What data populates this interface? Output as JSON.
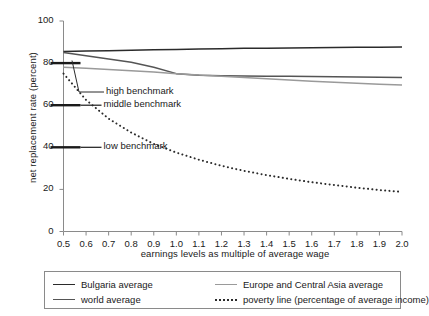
{
  "chart_data": {
    "type": "line",
    "title": "",
    "xlabel": "earnings levels as multiple of average wage",
    "ylabel": "net replacement rate (percent)",
    "xlim": [
      0.5,
      2.0
    ],
    "ylim": [
      0,
      100
    ],
    "grid": false,
    "legend_position": "bottom",
    "x_ticks": [
      "0.5",
      "0.6",
      "0.7",
      "0.8",
      "0.9",
      "1.0",
      "1.1",
      "1.2",
      "1.3",
      "1.4",
      "1.5",
      "1.6",
      "1.7",
      "1.8",
      "1.9",
      "2.0"
    ],
    "y_ticks": [
      "0",
      "20",
      "40",
      "60",
      "80",
      "100"
    ],
    "x": [
      0.5,
      0.6,
      0.7,
      0.8,
      0.9,
      1.0,
      1.1,
      1.2,
      1.3,
      1.4,
      1.5,
      1.6,
      1.7,
      1.8,
      1.9,
      2.0
    ],
    "series": [
      {
        "name": "Bulgaria average",
        "style": "solid",
        "color": "#2b2b2b",
        "values": [
          85.5,
          85.7,
          85.9,
          86.1,
          86.3,
          86.5,
          86.7,
          86.8,
          87.0,
          87.1,
          87.2,
          87.3,
          87.4,
          87.5,
          87.5,
          87.6
        ]
      },
      {
        "name": "world average",
        "style": "solid",
        "color": "#555555",
        "values": [
          85.0,
          83.5,
          82.0,
          80.4,
          78.0,
          75.0,
          74.2,
          74.0,
          73.9,
          73.8,
          73.7,
          73.6,
          73.5,
          73.4,
          73.3,
          73.2
        ]
      },
      {
        "name": "Europe and Central Asia average",
        "style": "solid",
        "color": "#9a9a9a",
        "values": [
          78.0,
          77.5,
          77.0,
          76.4,
          75.8,
          75.0,
          74.4,
          73.8,
          73.2,
          72.6,
          72.0,
          71.4,
          70.9,
          70.4,
          70.0,
          69.6
        ]
      },
      {
        "name": "poverty line (percentage of average income)",
        "style": "dotted",
        "color": "#2b2b2b",
        "values": [
          75.0,
          62.5,
          53.6,
          47.0,
          41.6,
          37.5,
          34.1,
          31.2,
          28.8,
          26.8,
          25.0,
          23.4,
          22.1,
          20.8,
          19.7,
          18.8
        ]
      }
    ],
    "annotations": [
      {
        "label": "high benchmark",
        "level": 80
      },
      {
        "label": "middle benchmark",
        "level": 60
      },
      {
        "label": "low benchmark",
        "level": 40
      }
    ]
  },
  "legend": {
    "items": [
      {
        "label": "Bulgaria average",
        "swatch": "solid-dark"
      },
      {
        "label": "world average",
        "swatch": "solid-mid"
      },
      {
        "label": "Europe and Central Asia average",
        "swatch": "solid-light"
      },
      {
        "label": "poverty line (percentage of average income)",
        "swatch": "dotted"
      }
    ]
  }
}
